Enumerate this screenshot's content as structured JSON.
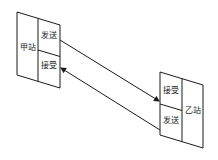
{
  "diagram": {
    "station_a": {
      "name": "甲站",
      "top_cell": "发送",
      "bottom_cell": "接受"
    },
    "station_b": {
      "name": "乙站",
      "top_cell": "接受",
      "bottom_cell": "发送"
    },
    "links": [
      {
        "from": "甲站 发送",
        "to": "乙站 接受",
        "direction": "right"
      },
      {
        "from": "乙站 发送",
        "to": "甲站 接受",
        "direction": "left"
      }
    ],
    "colors": {
      "stroke": "#1a1a1a",
      "background": "#ffffff"
    }
  }
}
